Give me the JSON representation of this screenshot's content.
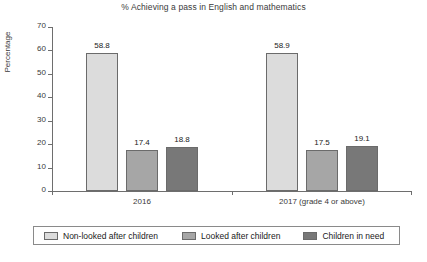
{
  "chart_data": {
    "type": "bar",
    "title": "% Achieving a pass in English and mathematics",
    "xlabel": "",
    "ylabel": "Percentage",
    "ylim": [
      0,
      70
    ],
    "yticks": [
      0,
      10,
      20,
      30,
      40,
      50,
      60,
      70
    ],
    "grid": false,
    "legend_position": "bottom",
    "categories": [
      "2016",
      "2017 (grade 4 or above)"
    ],
    "series": [
      {
        "name": "Non-looked after children",
        "color": "#dcdcdc",
        "values": [
          58.8,
          58.9
        ],
        "labels": [
          "58.8",
          "58.9"
        ]
      },
      {
        "name": "Looked after children",
        "color": "#a6a6a6",
        "values": [
          17.4,
          17.5
        ],
        "labels": [
          "17.4",
          "17.5"
        ]
      },
      {
        "name": "Children in need",
        "color": "#787878",
        "values": [
          18.8,
          19.1
        ],
        "labels": [
          "18.8",
          "19.1"
        ]
      }
    ]
  }
}
